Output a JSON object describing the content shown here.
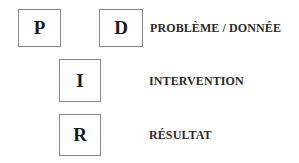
{
  "diagram": {
    "boxes": [
      {
        "id": "p",
        "letter": "P"
      },
      {
        "id": "d",
        "letter": "D"
      },
      {
        "id": "i",
        "letter": "I"
      },
      {
        "id": "r",
        "letter": "R"
      }
    ],
    "labels": [
      {
        "for": "d",
        "text": "PROBLÈME / DONNÉE"
      },
      {
        "for": "i",
        "text": "INTERVENTION"
      },
      {
        "for": "r",
        "text": "RÉSULTAT"
      }
    ]
  }
}
